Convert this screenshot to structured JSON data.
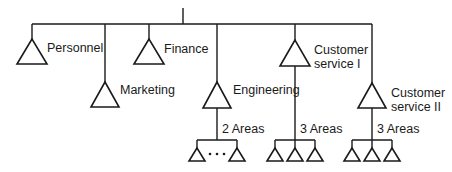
{
  "diagram": {
    "type": "organization-chart",
    "root": {
      "label": ""
    },
    "departments": [
      {
        "id": "personnel",
        "label": "Personnel"
      },
      {
        "id": "marketing",
        "label": "Marketing"
      },
      {
        "id": "finance",
        "label": "Finance"
      },
      {
        "id": "engineering",
        "label": "Engineering",
        "sub_label": "2 Areas",
        "sub_count": 2,
        "ellipsis": "..."
      },
      {
        "id": "customer-service-1",
        "label_line1": "Customer",
        "label_line2": "service I",
        "sub_label": "3 Areas",
        "sub_count": 3
      },
      {
        "id": "customer-service-2",
        "label_line1": "Customer",
        "label_line2": "service II",
        "sub_label": "3 Areas",
        "sub_count": 3
      }
    ]
  }
}
